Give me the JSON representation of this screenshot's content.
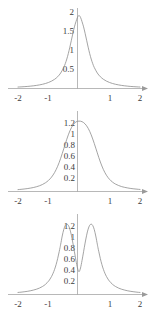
{
  "figure": {
    "panel_count": 3,
    "background_color": "#ffffff",
    "curve_color": "#8d8d8d",
    "axis_color": "#9a9a9a",
    "label_color": "#3c3c3c"
  },
  "chart_data": [
    {
      "type": "line",
      "title": "",
      "subtitle": "",
      "xlabel": "",
      "ylabel": "",
      "xlim": [
        -2,
        2
      ],
      "ylim": [
        0,
        2.15
      ],
      "grid": false,
      "legend": null,
      "annotations": [],
      "xticks": [
        -2,
        -1,
        1,
        2
      ],
      "xticklabels": [
        "-2",
        "-1",
        "1",
        "2"
      ],
      "yticks": [
        0.5,
        1,
        1.5,
        2
      ],
      "yticklabels": [
        "0.5",
        "1",
        "1.5",
        "2"
      ],
      "peak": {
        "x": 0,
        "y": 2
      },
      "shape": "single sharp cusped peak at x=0 with long heavy tails",
      "series": [
        {
          "name": "curve-1",
          "x": [
            -2.0,
            -1.9,
            -1.8,
            -1.7,
            -1.6,
            -1.5,
            -1.4,
            -1.3,
            -1.2,
            -1.1,
            -1.0,
            -0.9,
            -0.8,
            -0.7,
            -0.6,
            -0.5,
            -0.45,
            -0.4,
            -0.35,
            -0.3,
            -0.25,
            -0.2,
            -0.15,
            -0.1,
            -0.05,
            0.0,
            0.05,
            0.1,
            0.15,
            0.2,
            0.25,
            0.3,
            0.35,
            0.4,
            0.45,
            0.5,
            0.6,
            0.7,
            0.8,
            0.9,
            1.0,
            1.1,
            1.2,
            1.3,
            1.4,
            1.5,
            1.6,
            1.7,
            1.8,
            1.9,
            2.0
          ],
          "y": [
            0.04,
            0.045,
            0.05,
            0.056,
            0.064,
            0.073,
            0.084,
            0.098,
            0.115,
            0.137,
            0.165,
            0.202,
            0.252,
            0.322,
            0.424,
            0.577,
            0.681,
            0.807,
            0.958,
            1.132,
            1.322,
            1.513,
            1.688,
            1.828,
            1.948,
            2.0,
            1.948,
            1.828,
            1.688,
            1.513,
            1.322,
            1.132,
            0.958,
            0.807,
            0.681,
            0.577,
            0.424,
            0.322,
            0.252,
            0.202,
            0.165,
            0.137,
            0.115,
            0.098,
            0.084,
            0.073,
            0.064,
            0.056,
            0.05,
            0.045,
            0.04
          ]
        }
      ]
    },
    {
      "type": "line",
      "title": "",
      "subtitle": "",
      "xlabel": "",
      "ylabel": "",
      "xlim": [
        -2,
        2
      ],
      "ylim": [
        0,
        1.45
      ],
      "grid": false,
      "legend": null,
      "annotations": [],
      "xticks": [
        -2,
        -1,
        1,
        2
      ],
      "xticklabels": [
        "-2",
        "-1",
        "1",
        "2"
      ],
      "yticks": [
        0.2,
        0.4,
        0.6,
        0.8,
        1,
        1.2
      ],
      "yticklabels": [
        "0.2",
        "0.4",
        "0.6",
        "0.8",
        "1",
        "1.2"
      ],
      "peak": {
        "x": 0.05,
        "y": 1.3
      },
      "shape": "single broad rounded plateau peak near x=0 with long tails",
      "series": [
        {
          "name": "curve-2",
          "x": [
            -2.0,
            -1.9,
            -1.8,
            -1.7,
            -1.6,
            -1.5,
            -1.4,
            -1.3,
            -1.2,
            -1.1,
            -1.0,
            -0.9,
            -0.8,
            -0.7,
            -0.6,
            -0.5,
            -0.4,
            -0.3,
            -0.2,
            -0.1,
            0.0,
            0.1,
            0.2,
            0.3,
            0.4,
            0.5,
            0.6,
            0.7,
            0.8,
            0.9,
            1.0,
            1.1,
            1.2,
            1.3,
            1.4,
            1.5,
            1.6,
            1.7,
            1.8,
            1.9,
            2.0
          ],
          "y": [
            0.035,
            0.04,
            0.046,
            0.053,
            0.062,
            0.073,
            0.087,
            0.105,
            0.129,
            0.161,
            0.205,
            0.266,
            0.351,
            0.466,
            0.615,
            0.789,
            0.966,
            1.118,
            1.226,
            1.285,
            1.3,
            1.29,
            1.248,
            1.168,
            1.046,
            0.888,
            0.713,
            0.545,
            0.405,
            0.3,
            0.225,
            0.173,
            0.136,
            0.11,
            0.09,
            0.076,
            0.065,
            0.056,
            0.049,
            0.043,
            0.038
          ]
        }
      ]
    },
    {
      "type": "line",
      "title": "",
      "subtitle": "",
      "xlabel": "",
      "ylabel": "",
      "xlim": [
        -2,
        2
      ],
      "ylim": [
        0,
        1.45
      ],
      "grid": false,
      "legend": null,
      "annotations": [],
      "xticks": [
        -2,
        -1,
        1,
        2
      ],
      "xticklabels": [
        "-2",
        "-1",
        "1",
        "2"
      ],
      "yticks": [
        0.2,
        0.4,
        0.6,
        0.8,
        1,
        1.2
      ],
      "yticklabels": [
        "0.2",
        "0.4",
        "0.6",
        "0.8",
        "1",
        "1.2"
      ],
      "peaks": [
        {
          "x": -0.62,
          "y": 1.3
        },
        {
          "x": 0.62,
          "y": 1.3
        }
      ],
      "valley": {
        "x": 0.0,
        "y": 0.42
      },
      "shape": "bimodal: two symmetric peaks near x=-0.62 and x=+0.62 with a dip at x=0",
      "series": [
        {
          "name": "curve-3",
          "x": [
            -2.0,
            -1.9,
            -1.8,
            -1.7,
            -1.6,
            -1.5,
            -1.4,
            -1.3,
            -1.2,
            -1.1,
            -1.0,
            -0.95,
            -0.9,
            -0.85,
            -0.8,
            -0.75,
            -0.7,
            -0.65,
            -0.62,
            -0.6,
            -0.55,
            -0.5,
            -0.45,
            -0.4,
            -0.35,
            -0.3,
            -0.25,
            -0.2,
            -0.15,
            -0.1,
            -0.05,
            0.0,
            0.05,
            0.1,
            0.15,
            0.2,
            0.25,
            0.3,
            0.35,
            0.4,
            0.45,
            0.5,
            0.55,
            0.6,
            0.62,
            0.65,
            0.7,
            0.75,
            0.8,
            0.85,
            0.9,
            0.95,
            1.0,
            1.1,
            1.2,
            1.3,
            1.4,
            1.5,
            1.6,
            1.7,
            1.8,
            1.9,
            2.0
          ],
          "y": [
            0.038,
            0.043,
            0.05,
            0.058,
            0.068,
            0.081,
            0.097,
            0.118,
            0.147,
            0.187,
            0.246,
            0.285,
            0.333,
            0.392,
            0.465,
            0.554,
            0.663,
            0.79,
            0.87,
            0.93,
            1.08,
            1.2,
            1.275,
            1.3,
            1.278,
            1.208,
            1.095,
            0.95,
            0.79,
            0.63,
            0.49,
            0.42,
            0.49,
            0.63,
            0.79,
            0.95,
            1.095,
            1.208,
            1.278,
            1.3,
            1.275,
            1.2,
            1.08,
            0.93,
            0.87,
            0.79,
            0.663,
            0.554,
            0.465,
            0.392,
            0.333,
            0.285,
            0.246,
            0.187,
            0.147,
            0.118,
            0.097,
            0.081,
            0.068,
            0.058,
            0.05,
            0.043,
            0.038
          ]
        }
      ]
    }
  ]
}
